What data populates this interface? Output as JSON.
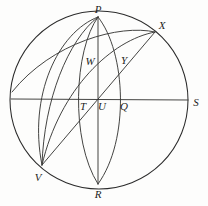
{
  "figure": {
    "background_color": "#fdfdfc",
    "line_color": "#2b2b2b",
    "label_color": "#1d1d1d",
    "circle": {
      "name": "primitive-circle",
      "center_x": 99,
      "center_y": 100,
      "radius": 89
    },
    "points": [
      {
        "id": "P",
        "label": "P",
        "x": 98,
        "y": 17,
        "label_x": 98,
        "label_y": 9
      },
      {
        "id": "X",
        "label": "X",
        "x": 155,
        "y": 32,
        "label_x": 162,
        "label_y": 25
      },
      {
        "id": "W",
        "label": "W",
        "x": 88,
        "y": 60,
        "label_x": 90,
        "label_y": 61
      },
      {
        "id": "Y",
        "label": "Y",
        "x": 121,
        "y": 58,
        "label_x": 124,
        "label_y": 60
      },
      {
        "id": "T",
        "label": "T",
        "x": 80,
        "y": 99,
        "label_x": 83,
        "label_y": 106
      },
      {
        "id": "U",
        "label": "U",
        "x": 98,
        "y": 99,
        "label_x": 102,
        "label_y": 106
      },
      {
        "id": "Q",
        "label": "Q",
        "x": 120,
        "y": 99,
        "label_x": 124,
        "label_y": 106
      },
      {
        "id": "S",
        "label": "S",
        "x": 188,
        "y": 100,
        "label_x": 196,
        "label_y": 102
      },
      {
        "id": "V",
        "label": "V",
        "x": 42,
        "y": 165,
        "label_x": 38,
        "label_y": 177
      },
      {
        "id": "R",
        "label": "R",
        "x": 98,
        "y": 184,
        "label_x": 98,
        "label_y": 194
      }
    ],
    "segments": [
      {
        "name": "horizontal-diameter-TS",
        "from": "left-circle",
        "to": "S",
        "x1": 11,
        "y1": 99,
        "x2": 188,
        "y2": 100
      },
      {
        "name": "vertical-diameter-PR",
        "from": "P",
        "to": "R",
        "x1": 98,
        "y1": 17,
        "x2": 98,
        "y2": 184
      },
      {
        "name": "chord-X-to-V",
        "from": "X",
        "to": "V",
        "x1": 155,
        "y1": 32,
        "x2": 42,
        "y2": 165
      },
      {
        "name": "chord-X-to-U-extended",
        "from": "X",
        "to": "V",
        "x1": 155,
        "y1": 32,
        "x2": 43,
        "y2": 166
      }
    ],
    "arcs": [
      {
        "name": "arc-P-to-R-left-bulge",
        "d": "M 98 17 C 74 50, 70 140, 98 184"
      },
      {
        "name": "arc-P-to-R-right-bulge",
        "d": "M 98 17 C 126 52, 130 140, 98 184"
      },
      {
        "name": "arc-P-to-V-outer",
        "d": "M 98 17 C 62 34, 34 96, 42 165"
      },
      {
        "name": "arc-P-to-V-inner",
        "d": "M 98 17 C 70 42, 48 100, 42 165"
      },
      {
        "name": "arc-X-to-V",
        "d": "M 155 32 C 106 38, 58 92, 42 165"
      },
      {
        "name": "arc-X-to-W-to-T",
        "d": "M 155 32 C 118 44, 86 70, 42 165"
      }
    ],
    "labels_count": 10
  }
}
